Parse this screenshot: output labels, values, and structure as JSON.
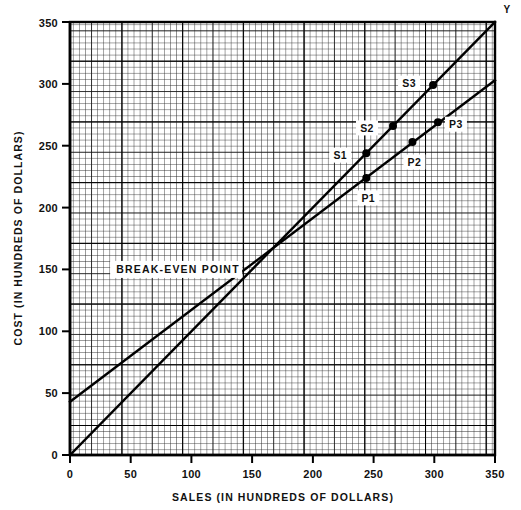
{
  "chart_data": {
    "type": "line",
    "title": "",
    "xlabel": "SALES (IN HUNDREDS OF DOLLARS)",
    "ylabel": "COST (IN HUNDREDS OF DOLLARS)",
    "xlim": [
      0,
      350
    ],
    "ylim": [
      0,
      350
    ],
    "xticks": [
      "0",
      "50",
      "100",
      "150",
      "200",
      "250",
      "300",
      "350"
    ],
    "xtick_values": [
      0,
      50,
      100,
      150,
      200,
      250,
      300,
      350
    ],
    "yticks": [
      "0",
      "50",
      "100",
      "150",
      "200",
      "250",
      "300",
      "350"
    ],
    "ytick_values": [
      0,
      50,
      100,
      150,
      200,
      250,
      300,
      350
    ],
    "grid": true,
    "grid_minor_step": 5,
    "grid_mid_step": 25,
    "grid_major_step": 50,
    "legend": "none",
    "series": [
      {
        "name": "Sales line",
        "id": "sales-line",
        "x": [
          0,
          350
        ],
        "y": [
          0,
          350
        ],
        "slope": 1.0,
        "intercept": 0,
        "points": [
          {
            "label": "S1",
            "x": 244,
            "y": 244,
            "label_dx": -26,
            "label_dy": 2
          },
          {
            "label": "S2",
            "x": 266,
            "y": 266,
            "label_dx": -26,
            "label_dy": 2
          },
          {
            "label": "S3",
            "x": 299,
            "y": 299,
            "label_dx": -24,
            "label_dy": -2
          }
        ]
      },
      {
        "name": "Cost line",
        "id": "cost-line",
        "x": [
          0,
          350
        ],
        "y": [
          43,
          303
        ],
        "slope": 0.743,
        "intercept": 43,
        "points": [
          {
            "label": "P1",
            "x": 244,
            "y": 224,
            "label_dx": 2,
            "label_dy": 20
          },
          {
            "label": "P2",
            "x": 282,
            "y": 253,
            "label_dx": 2,
            "label_dy": 20
          },
          {
            "label": "P3",
            "x": 303,
            "y": 269,
            "label_dx": 18,
            "label_dy": 2
          }
        ]
      }
    ],
    "annotations": [
      {
        "label": "BREAK-EVEN POINT",
        "x": 38,
        "y": 150,
        "name": "break-even-point-annotation"
      },
      {
        "label": "Y",
        "x": 352,
        "y": 356,
        "name": "y-axis-end-label"
      }
    ]
  }
}
